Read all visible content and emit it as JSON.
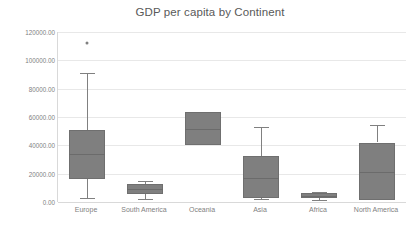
{
  "chart_data": {
    "type": "box",
    "title": "GDP per capita by Continent",
    "xlabel": "",
    "ylabel": "",
    "ylim": [
      0,
      120000
    ],
    "ytick_step": 20000,
    "ytick_labels": [
      "120000.00",
      "100000.00",
      "80000.00",
      "60000.00",
      "40000.00",
      "20000.00",
      "0.00"
    ],
    "ytick_values": [
      120000,
      100000,
      80000,
      60000,
      40000,
      20000,
      0
    ],
    "grid": true,
    "legend": "none",
    "categories": [
      "Europe",
      "South America",
      "Oceania",
      "Asia",
      "Africa",
      "North America"
    ],
    "boxes": [
      {
        "category": "Europe",
        "whisker_low": 3000,
        "q1": 16500,
        "median": 34000,
        "q3": 51000,
        "whisker_high": 91000,
        "outliers": [
          112000
        ]
      },
      {
        "category": "South America",
        "whisker_low": 2300,
        "q1": 5300,
        "median": 9200,
        "q3": 12500,
        "whisker_high": 14800,
        "outliers": []
      },
      {
        "category": "Oceania",
        "whisker_low": 40000,
        "q1": 40000,
        "median": 51500,
        "q3": 63200,
        "whisker_high": 63200,
        "outliers": []
      },
      {
        "category": "Asia",
        "whisker_low": 2000,
        "q1": 2900,
        "median": 17000,
        "q3": 32500,
        "whisker_high": 53000,
        "outliers": []
      },
      {
        "category": "Africa",
        "whisker_low": 1600,
        "q1": 2800,
        "median": 4300,
        "q3": 6200,
        "whisker_high": 7300,
        "outliers": []
      },
      {
        "category": "North America",
        "whisker_low": 1000,
        "q1": 1200,
        "median": 21000,
        "q3": 42000,
        "whisker_high": 54500,
        "outliers": []
      }
    ],
    "colors": {
      "box_fill": "#7f7f7f",
      "box_border": "#6f6f6f",
      "whisker": "#808080",
      "gridline": "#e8e8e8",
      "axis": "#d9d9d9",
      "text": "#7f7f7f",
      "title_text": "#595959",
      "background": "#ffffff"
    }
  }
}
